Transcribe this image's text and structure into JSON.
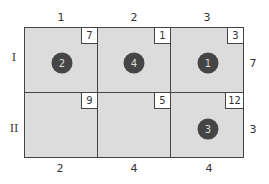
{
  "columns": [
    {
      "label": "1",
      "demand": "2"
    },
    {
      "label": "2",
      "demand": "4"
    },
    {
      "label": "3",
      "demand": "4"
    }
  ],
  "rows": [
    {
      "label": "I",
      "supply": "7"
    },
    {
      "label": "II",
      "supply": "3"
    }
  ],
  "cells": [
    [
      {
        "cost": "7",
        "allocation": "2"
      },
      {
        "cost": "1",
        "allocation": "4"
      },
      {
        "cost": "3",
        "allocation": "1"
      }
    ],
    [
      {
        "cost": "9",
        "allocation": null
      },
      {
        "cost": "5",
        "allocation": null
      },
      {
        "cost": "12",
        "allocation": "3"
      }
    ]
  ],
  "colors": {
    "cell_fill": "#dcdcdc",
    "allocation_circle": "#454545",
    "grid_line": "#444444"
  }
}
